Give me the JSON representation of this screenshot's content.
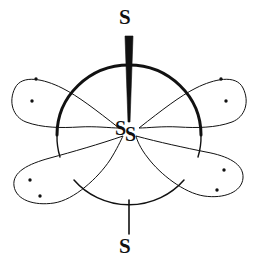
{
  "figure": {
    "kind": "molecular-structure-diagram",
    "background_color": "#ffffff",
    "stroke_color": "#111111",
    "width": 258,
    "height": 267
  },
  "atoms": {
    "top": {
      "symbol": "S",
      "x": 129,
      "y": 18
    },
    "bottom": {
      "symbol": "S",
      "x": 129,
      "y": 247
    },
    "center_primary": {
      "symbol": "S",
      "x": 122,
      "y": 128
    },
    "center_secondary": {
      "symbol": "S",
      "x": 132,
      "y": 134
    }
  },
  "bonds": [
    {
      "name": "wedge-bond-up",
      "style": "bold-wedge",
      "from": "center",
      "to": "top",
      "wide_end": "top",
      "wide_width": 7,
      "narrow_width": 1,
      "x1": 129,
      "y1": 36,
      "x2": 129,
      "y2": 122
    },
    {
      "name": "plain-bond-down",
      "style": "plain-line",
      "from": "center",
      "to": "bottom",
      "stroke_width": 1.6,
      "x1": 129,
      "y1": 200,
      "x2": 129,
      "y2": 234
    }
  ],
  "sphere": {
    "name": "central-sphere-outline",
    "cx": 129,
    "cy": 135,
    "rx": 72,
    "ry": 70,
    "upper_arc_stroke_width": 3.0,
    "lower_arc_stroke_width": 1.5
  },
  "lone_pair_lobes": [
    {
      "name": "lone-pair-lobe-upper-left",
      "position": "upper-left",
      "electron_count": 2,
      "dots": [
        {
          "x": 36,
          "y": 79
        },
        {
          "x": 32,
          "y": 101
        }
      ],
      "stroke_width": 1.0
    },
    {
      "name": "lone-pair-lobe-upper-right",
      "position": "upper-right",
      "electron_count": 2,
      "dots": [
        {
          "x": 221,
          "y": 79
        },
        {
          "x": 226,
          "y": 101
        }
      ],
      "stroke_width": 1.0
    },
    {
      "name": "lone-pair-lobe-lower-left",
      "position": "lower-left",
      "electron_count": 2,
      "dots": [
        {
          "x": 30,
          "y": 180
        },
        {
          "x": 40,
          "y": 196
        }
      ],
      "stroke_width": 1.0
    },
    {
      "name": "lone-pair-lobe-lower-right",
      "position": "lower-right",
      "electron_count": 2,
      "dots": [
        {
          "x": 224,
          "y": 170
        },
        {
          "x": 217,
          "y": 190
        }
      ],
      "stroke_width": 1.0
    }
  ]
}
